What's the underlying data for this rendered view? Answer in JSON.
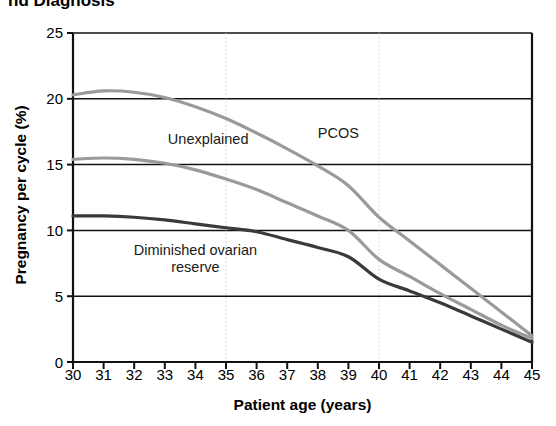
{
  "figure": {
    "title_partial": "nd Diagnosis",
    "title_note": "title is cropped at the top edge of the screenshot"
  },
  "chart_data": {
    "type": "line",
    "title": "nd Diagnosis",
    "xlabel": "Patient age (years)",
    "ylabel": "Pregnancy per cycle (%)",
    "xlim": [
      30,
      45
    ],
    "ylim": [
      0,
      25
    ],
    "xticks": [
      30,
      31,
      32,
      33,
      34,
      35,
      36,
      37,
      38,
      39,
      40,
      41,
      42,
      43,
      44,
      45
    ],
    "yticks": [
      0,
      5,
      10,
      15,
      20,
      25
    ],
    "grid": "horizontal solid gridlines at every y tick; dotted vertical gridlines at x = 35 and x = 40",
    "legend": "inline curve annotations, no legend box",
    "x": [
      30,
      31,
      32,
      33,
      34,
      35,
      36,
      37,
      38,
      39,
      40,
      41,
      42,
      43,
      44,
      45
    ],
    "series": [
      {
        "name": "PCOS",
        "color": "#9a9a9a",
        "label_x": 38,
        "label_y": 17.3,
        "values": [
          20.3,
          20.6,
          20.5,
          20.1,
          19.4,
          18.5,
          17.4,
          16.2,
          14.9,
          13.4,
          11.0,
          9.2,
          7.4,
          5.6,
          3.8,
          2.0
        ]
      },
      {
        "name": "Unexplained",
        "color": "#9a9a9a",
        "label_x": 33.1,
        "label_y": 16.9,
        "values": [
          15.4,
          15.5,
          15.4,
          15.1,
          14.6,
          13.9,
          13.1,
          12.1,
          11.1,
          10.0,
          7.8,
          6.5,
          5.2,
          4.0,
          2.8,
          1.8
        ]
      },
      {
        "name": "Diminished ovarian reserve",
        "label_lines": [
          "Diminished ovarian",
          "reserve"
        ],
        "color": "#3a3a3a",
        "label_x": 34.0,
        "label_y": 8.4,
        "values": [
          11.1,
          11.1,
          11.0,
          10.8,
          10.5,
          10.2,
          9.9,
          9.3,
          8.7,
          8.0,
          6.3,
          5.4,
          4.5,
          3.5,
          2.5,
          1.5
        ]
      }
    ]
  }
}
